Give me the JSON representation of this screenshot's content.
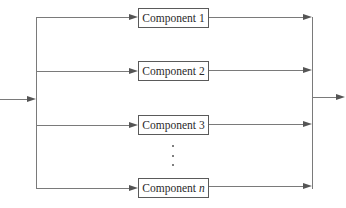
{
  "diagram": {
    "type": "parallel-system-block-diagram",
    "components": [
      {
        "label": "Component",
        "index": "1",
        "index_italic": false
      },
      {
        "label": "Component",
        "index": "2",
        "index_italic": false
      },
      {
        "label": "Component",
        "index": "3",
        "index_italic": false
      },
      {
        "label": "Component",
        "index": "n",
        "index_italic": true
      }
    ],
    "ellipsis": "⋮",
    "colors": {
      "line": "#7a7a7a",
      "box_border": "#5a5a5a",
      "text": "#2a2a2a",
      "background": "#ffffff"
    }
  }
}
